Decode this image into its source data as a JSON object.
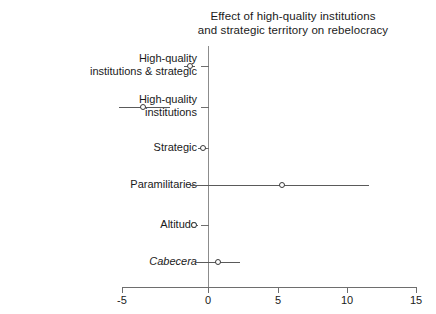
{
  "chart_data": {
    "type": "scatter",
    "title": "Effect of high-quality institutions and strategic territory on rebelocracy",
    "title_lines": [
      "Effect of high-quality institutions",
      "and strategic territory on rebelocracy"
    ],
    "orientation": "horizontal",
    "xlabel": "",
    "ylabel": "",
    "xlim": [
      -5,
      15
    ],
    "xticks": [
      -5,
      0,
      5,
      10,
      15
    ],
    "xticklabels": [
      "-5",
      "0",
      "5",
      "10",
      "15"
    ],
    "grid": false,
    "legend": false,
    "reference_line": 0,
    "categories": [
      "High-quality institutions & strategic",
      "High-quality institutions",
      "Strategic",
      "Paramilitaries",
      "Altitude",
      "Cabecera"
    ],
    "category_labels": [
      [
        "High-quality",
        "institutions & strategic"
      ],
      [
        "High-quality",
        "institutions"
      ],
      [
        "Strategic"
      ],
      [
        "Paramilitaries"
      ],
      [
        "Altitude"
      ],
      [
        "Cabecera"
      ]
    ],
    "category_styles": [
      "normal",
      "normal",
      "normal",
      "normal",
      "normal",
      "italic"
    ],
    "series": [
      {
        "name": "Coefficient estimate",
        "values": [
          -0.4,
          -3.6,
          0.5,
          5.9,
          -0.1,
          1.5
        ],
        "ci_low": [
          -0.8,
          -5.2,
          0.2,
          -0.4,
          -0.3,
          0.0
        ],
        "ci_high": [
          0.0,
          -1.7,
          0.8,
          11.8,
          0.2,
          3.0
        ]
      }
    ],
    "marker": "open-circle",
    "marker_color": "#3a3a3a",
    "line_color": "#5a5a5a"
  },
  "axes": {
    "x_ticks": [
      {
        "value": -5,
        "label": "-5",
        "px": 122
      },
      {
        "value": 0,
        "label": "0",
        "px": 208
      },
      {
        "value": 5,
        "label": "5",
        "px": 278
      },
      {
        "value": 10,
        "label": "10",
        "px": 347
      },
      {
        "value": 15,
        "label": "15",
        "px": 416
      }
    ],
    "y_rows": [
      {
        "index": 0,
        "px": 66
      },
      {
        "index": 1,
        "px": 107
      },
      {
        "index": 2,
        "px": 148
      },
      {
        "index": 3,
        "px": 185
      },
      {
        "index": 4,
        "px": 225
      },
      {
        "index": 5,
        "px": 262
      }
    ]
  },
  "colors": {
    "background": "#ffffff",
    "axis": "#6e6e6e",
    "text": "#1a1a1a",
    "marker": "#3a3a3a",
    "interval": "#5a5a5a"
  }
}
